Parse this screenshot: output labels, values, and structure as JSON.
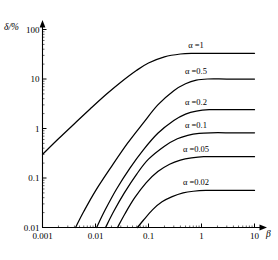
{
  "chart_data": {
    "type": "line",
    "title": "",
    "xlabel": "β",
    "ylabel": "δ/%",
    "xscale": "log",
    "yscale": "log",
    "xlim": [
      0.001,
      10
    ],
    "ylim": [
      0.01,
      100
    ],
    "grid": false,
    "legend_position": "inline-right",
    "xticks": [
      {
        "value": 0.001,
        "label": "0.001"
      },
      {
        "value": 0.01,
        "label": "0.01"
      },
      {
        "value": 0.1,
        "label": "0.1"
      },
      {
        "value": 1,
        "label": "1"
      },
      {
        "value": 10,
        "label": "10"
      }
    ],
    "yticks": [
      {
        "value": 0.01,
        "label": "0.01"
      },
      {
        "value": 0.1,
        "label": "0.1"
      },
      {
        "value": 1,
        "label": "1"
      },
      {
        "value": 10,
        "label": "10"
      },
      {
        "value": 100,
        "label": "100"
      }
    ],
    "series": [
      {
        "name": "alpha-1",
        "label": "α =1",
        "alpha": 1,
        "plateau": 33,
        "points": [
          [
            0.001,
            0.3
          ],
          [
            0.002,
            0.62
          ],
          [
            0.004,
            1.25
          ],
          [
            0.008,
            2.5
          ],
          [
            0.016,
            4.9
          ],
          [
            0.03,
            8.6
          ],
          [
            0.06,
            15
          ],
          [
            0.1,
            21
          ],
          [
            0.2,
            28
          ],
          [
            0.4,
            32
          ],
          [
            0.7,
            33
          ],
          [
            1.5,
            33
          ],
          [
            10,
            33
          ]
        ]
      },
      {
        "name": "alpha-0.5",
        "label": "α =0.5",
        "alpha": 0.5,
        "plateau": 10,
        "points": [
          [
            0.0042,
            0.01
          ],
          [
            0.006,
            0.021
          ],
          [
            0.01,
            0.055
          ],
          [
            0.02,
            0.17
          ],
          [
            0.04,
            0.5
          ],
          [
            0.08,
            1.3
          ],
          [
            0.15,
            3.0
          ],
          [
            0.3,
            5.8
          ],
          [
            0.5,
            8.0
          ],
          [
            0.8,
            9.5
          ],
          [
            1.3,
            10
          ],
          [
            3,
            10
          ],
          [
            10,
            10
          ]
        ]
      },
      {
        "name": "alpha-0.2",
        "label": "α =0.2",
        "alpha": 0.2,
        "plateau": 2.4,
        "points": [
          [
            0.0105,
            0.01
          ],
          [
            0.015,
            0.022
          ],
          [
            0.025,
            0.06
          ],
          [
            0.045,
            0.16
          ],
          [
            0.08,
            0.37
          ],
          [
            0.15,
            0.8
          ],
          [
            0.3,
            1.45
          ],
          [
            0.5,
            1.95
          ],
          [
            0.8,
            2.25
          ],
          [
            1.4,
            2.4
          ],
          [
            3,
            2.4
          ],
          [
            10,
            2.4
          ]
        ]
      },
      {
        "name": "alpha-0.1",
        "label": "α =0.1",
        "alpha": 0.1,
        "plateau": 0.82,
        "points": [
          [
            0.0155,
            0.01
          ],
          [
            0.022,
            0.021
          ],
          [
            0.035,
            0.05
          ],
          [
            0.06,
            0.12
          ],
          [
            0.1,
            0.24
          ],
          [
            0.2,
            0.44
          ],
          [
            0.35,
            0.62
          ],
          [
            0.55,
            0.73
          ],
          [
            0.9,
            0.8
          ],
          [
            1.5,
            0.82
          ],
          [
            4,
            0.82
          ],
          [
            10,
            0.82
          ]
        ]
      },
      {
        "name": "alpha-0.05",
        "label": "α =0.05",
        "alpha": 0.05,
        "plateau": 0.27,
        "points": [
          [
            0.026,
            0.01
          ],
          [
            0.036,
            0.019
          ],
          [
            0.055,
            0.04
          ],
          [
            0.09,
            0.08
          ],
          [
            0.15,
            0.135
          ],
          [
            0.25,
            0.19
          ],
          [
            0.4,
            0.23
          ],
          [
            0.65,
            0.255
          ],
          [
            1.1,
            0.27
          ],
          [
            2.5,
            0.27
          ],
          [
            10,
            0.27
          ]
        ]
      },
      {
        "name": "alpha-0.02",
        "label": "α =0.02",
        "alpha": 0.02,
        "plateau": 0.056,
        "points": [
          [
            0.062,
            0.01
          ],
          [
            0.08,
            0.014
          ],
          [
            0.12,
            0.023
          ],
          [
            0.18,
            0.033
          ],
          [
            0.28,
            0.042
          ],
          [
            0.45,
            0.05
          ],
          [
            0.7,
            0.054
          ],
          [
            1.2,
            0.056
          ],
          [
            3,
            0.056
          ],
          [
            10,
            0.056
          ]
        ]
      }
    ]
  },
  "axes": {
    "y_axis_title": "δ/%",
    "x_axis_title": "β"
  },
  "colors": {
    "line": "#000000",
    "axis": "#000000",
    "background": "#ffffff"
  }
}
